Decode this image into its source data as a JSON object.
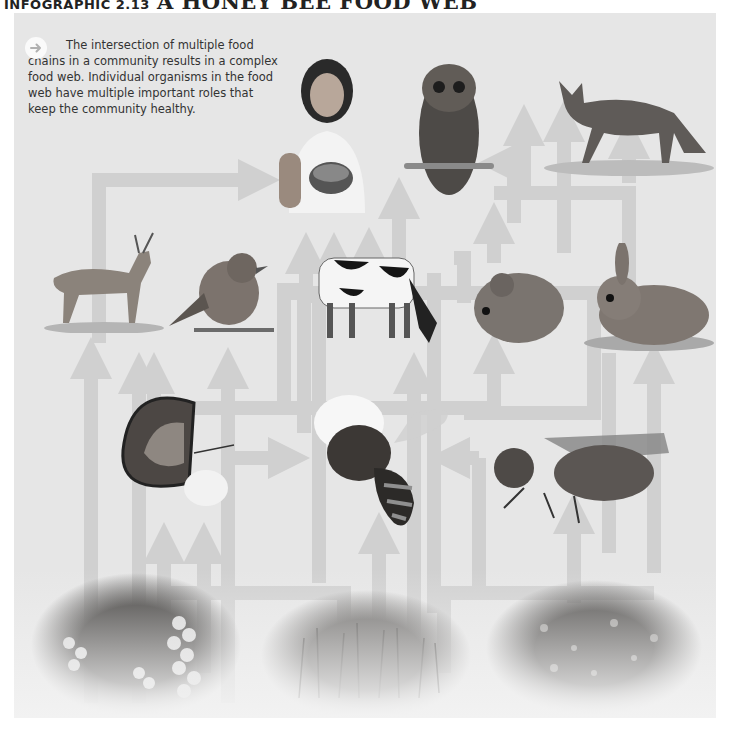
{
  "title": {
    "prefix": "INFOGRAPHIC 2.13",
    "main": "A HONEY BEE FOOD WEB"
  },
  "intro": {
    "icon": "arrow-right-circle-icon",
    "text": "The intersection of multiple food chains in a community results in a complex food web. Individual organisms in the food web have multiple important roles that keep the community healthy."
  },
  "colors": {
    "panel_background": "#e6e6e6",
    "arrow": "#cfcfcf",
    "title_text": "#222222",
    "body_text": "#333333"
  },
  "organisms": {
    "top_consumers": [
      {
        "name": "Human",
        "icon": "woman-eating-fruit-image"
      },
      {
        "name": "Owl",
        "icon": "owl-image"
      },
      {
        "name": "Fox",
        "icon": "fox-image"
      }
    ],
    "secondary_consumers": [
      {
        "name": "Deer",
        "icon": "deer-image"
      },
      {
        "name": "Bird",
        "icon": "bird-image"
      },
      {
        "name": "Cow",
        "icon": "cow-image"
      },
      {
        "name": "Mouse",
        "icon": "mouse-image"
      },
      {
        "name": "Rabbit",
        "icon": "rabbit-image"
      }
    ],
    "insects": [
      {
        "name": "Butterfly",
        "icon": "butterfly-image"
      },
      {
        "name": "Honey bee",
        "icon": "honey-bee-image"
      },
      {
        "name": "Fly",
        "icon": "fly-image"
      }
    ],
    "producers": [
      {
        "name": "Blueberries",
        "icon": "blueberry-bush-image"
      },
      {
        "name": "Meadow grasses",
        "icon": "meadow-image"
      },
      {
        "name": "Clover / wildflowers",
        "icon": "clover-image"
      }
    ]
  }
}
